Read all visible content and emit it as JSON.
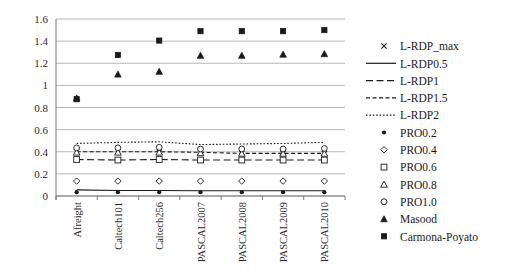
{
  "chart_data": {
    "type": "scatter",
    "title": "",
    "xlabel": "",
    "ylabel": "",
    "ylim": [
      0,
      1.6
    ],
    "ytick_values": [
      0,
      0.2,
      0.4,
      0.6,
      0.8,
      1,
      1.2,
      1.4,
      1.6
    ],
    "ytick_labels": [
      "0",
      "0.2",
      "0.4",
      "0.6",
      "0.8",
      "1",
      "1.2",
      "1.4",
      "1.6"
    ],
    "grid": true,
    "legend_position": "right",
    "categories": [
      "Afreight",
      "Caltech101",
      "Caltech256",
      "PASCAL2007",
      "PASCAL2008",
      "PASCAL2009",
      "PASCAL2010"
    ],
    "series": [
      {
        "name": "L-RDP_max",
        "marker": "cross",
        "line": "none",
        "color": "#1a1a1a",
        "values": [
          0.4,
          0.4,
          0.395,
          0.4,
          0.385,
          0.385,
          0.385
        ]
      },
      {
        "name": "L-RDP0.5",
        "marker": "none",
        "line": "solid",
        "color": "#1a1a1a",
        "values": [
          0.055,
          0.05,
          0.05,
          0.048,
          0.048,
          0.048,
          0.048
        ]
      },
      {
        "name": "L-RDP1",
        "marker": "none",
        "line": "longdash",
        "color": "#1a1a1a",
        "values": [
          0.33,
          0.325,
          0.33,
          0.325,
          0.325,
          0.325,
          0.325
        ]
      },
      {
        "name": "L-RDP1.5",
        "marker": "none",
        "line": "dash",
        "color": "#1a1a1a",
        "values": [
          0.4,
          0.4,
          0.4,
          0.395,
          0.385,
          0.385,
          0.385
        ]
      },
      {
        "name": "L-RDP2",
        "marker": "none",
        "line": "dot",
        "color": "#1a1a1a",
        "values": [
          0.475,
          0.485,
          0.49,
          0.465,
          0.47,
          0.475,
          0.485
        ]
      },
      {
        "name": "PRO0.2",
        "marker": "circle-filled",
        "line": "none",
        "color": "#1a1a1a",
        "values": [
          0.035,
          0.035,
          0.035,
          0.035,
          0.035,
          0.035,
          0.035
        ]
      },
      {
        "name": "PRO0.4",
        "marker": "diamond-open",
        "line": "none",
        "color": "#1a1a1a",
        "values": [
          0.135,
          0.135,
          0.135,
          0.135,
          0.135,
          0.135,
          0.135
        ]
      },
      {
        "name": "PRO0.6",
        "marker": "square-open",
        "line": "none",
        "color": "#1a1a1a",
        "values": [
          0.33,
          0.325,
          0.33,
          0.325,
          0.325,
          0.325,
          0.325
        ]
      },
      {
        "name": "PRO0.8",
        "marker": "triangle-open",
        "line": "none",
        "color": "#1a1a1a",
        "values": [
          0.395,
          0.395,
          0.395,
          0.39,
          0.385,
          0.385,
          0.385
        ]
      },
      {
        "name": "PRO1.0",
        "marker": "circle-open",
        "line": "none",
        "color": "#1a1a1a",
        "values": [
          0.435,
          0.435,
          0.44,
          0.425,
          0.425,
          0.425,
          0.43
        ]
      },
      {
        "name": "Masood",
        "marker": "triangle-filled",
        "line": "none",
        "color": "#1a1a1a",
        "values": [
          0.885,
          1.1,
          1.125,
          1.27,
          1.27,
          1.28,
          1.285
        ]
      },
      {
        "name": "Carmona-Poyato",
        "marker": "square-filled",
        "line": "none",
        "color": "#1a1a1a",
        "values": [
          0.875,
          1.275,
          1.405,
          1.49,
          1.49,
          1.49,
          1.5
        ]
      }
    ],
    "legend_entries": [
      {
        "label": "L-RDP_max",
        "glyph": "cross"
      },
      {
        "label": "L-RDP0.5",
        "glyph": "line-solid"
      },
      {
        "label": "L-RDP1",
        "glyph": "line-longdash"
      },
      {
        "label": "L-RDP1.5",
        "glyph": "line-dash"
      },
      {
        "label": "L-RDP2",
        "glyph": "line-dot"
      },
      {
        "label": "PRO0.2",
        "glyph": "circle-filled"
      },
      {
        "label": "PRO0.4",
        "glyph": "diamond-open"
      },
      {
        "label": "PRO0.6",
        "glyph": "square-open"
      },
      {
        "label": "PRO0.8",
        "glyph": "triangle-open"
      },
      {
        "label": "PRO1.0",
        "glyph": "circle-open"
      },
      {
        "label": "Masood",
        "glyph": "triangle-filled"
      },
      {
        "label": "Carmona-Poyato",
        "glyph": "square-filled"
      }
    ]
  }
}
